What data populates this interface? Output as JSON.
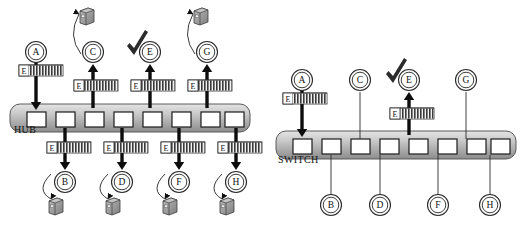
{
  "figure": {
    "title": "",
    "background_color": "#ffffff",
    "panels": [
      {
        "id": "hub-panel",
        "device_label": "HUB",
        "device_label_x": 14,
        "device_label_y": 133,
        "bar": {
          "x": 10,
          "y": 104,
          "width": 240,
          "height": 28,
          "radius": 10,
          "fill_top": "#d8d8d8",
          "fill_bottom": "#8e8e8e",
          "stroke": "#4a4a4a"
        },
        "ports": [
          {
            "id": "p1",
            "x": 27,
            "y": 112,
            "w": 19,
            "h": 15
          },
          {
            "id": "p2",
            "x": 56,
            "y": 112,
            "w": 19,
            "h": 15
          },
          {
            "id": "p3",
            "x": 85,
            "y": 112,
            "w": 19,
            "h": 15
          },
          {
            "id": "p4",
            "x": 114,
            "y": 112,
            "w": 19,
            "h": 15
          },
          {
            "id": "p5",
            "x": 143,
            "y": 112,
            "w": 19,
            "h": 15
          },
          {
            "id": "p6",
            "x": 172,
            "y": 112,
            "w": 19,
            "h": 15
          },
          {
            "id": "p7",
            "x": 201,
            "y": 112,
            "w": 19,
            "h": 15
          },
          {
            "id": "p8",
            "x": 225,
            "y": 112,
            "w": 19,
            "h": 15
          }
        ],
        "top_nodes": [
          {
            "label": "A",
            "cx": 36,
            "cy": 52,
            "has_computer": false,
            "checked": false
          },
          {
            "label": "C",
            "cx": 93,
            "cy": 52,
            "has_computer": true,
            "checked": false
          },
          {
            "label": "E",
            "cx": 150,
            "cy": 52,
            "has_computer": false,
            "checked": true
          },
          {
            "label": "G",
            "cx": 207,
            "cy": 52,
            "has_computer": true,
            "checked": false
          }
        ],
        "bottom_nodes": [
          {
            "label": "B",
            "cx": 65,
            "cy": 182,
            "has_computer": true
          },
          {
            "label": "D",
            "cx": 122,
            "cy": 182,
            "has_computer": true
          },
          {
            "label": "F",
            "cx": 179,
            "cy": 182,
            "has_computer": true
          },
          {
            "label": "H",
            "cx": 236,
            "cy": 182,
            "has_computer": true
          }
        ],
        "frames": [
          {
            "text": "E",
            "x": 19,
            "y": 65,
            "w": 44,
            "h": 11,
            "direction": "down"
          },
          {
            "text": "E",
            "x": 74,
            "y": 80,
            "w": 44,
            "h": 11,
            "direction": "up"
          },
          {
            "text": "E",
            "x": 131,
            "y": 80,
            "w": 44,
            "h": 11,
            "direction": "up"
          },
          {
            "text": "E",
            "x": 188,
            "y": 80,
            "w": 44,
            "h": 11,
            "direction": "up"
          },
          {
            "text": "E",
            "x": 47,
            "y": 142,
            "w": 44,
            "h": 11,
            "direction": "down"
          },
          {
            "text": "E",
            "x": 104,
            "y": 142,
            "w": 44,
            "h": 11,
            "direction": "down"
          },
          {
            "text": "E",
            "x": 161,
            "y": 142,
            "w": 44,
            "h": 11,
            "direction": "down"
          },
          {
            "text": "E",
            "x": 218,
            "y": 142,
            "w": 44,
            "h": 11,
            "direction": "down"
          }
        ],
        "arrows": [
          {
            "from_node": "A",
            "to_port": "p1",
            "x": 36,
            "y1": 62,
            "y2": 110,
            "dir": "down",
            "bold": true
          },
          {
            "to_node": "C",
            "from_port": "p3",
            "x": 93,
            "y1": 108,
            "y2": 64,
            "dir": "up",
            "bold": true
          },
          {
            "to_node": "E",
            "from_port": "p5",
            "x": 150,
            "y1": 108,
            "y2": 64,
            "dir": "up",
            "bold": true
          },
          {
            "to_node": "G",
            "from_port": "p7",
            "x": 207,
            "y1": 108,
            "y2": 64,
            "dir": "up",
            "bold": true
          },
          {
            "to_node": "B",
            "from_port": "p2",
            "x": 65,
            "y1": 128,
            "y2": 170,
            "dir": "down",
            "bold": true
          },
          {
            "to_node": "D",
            "from_port": "p4",
            "x": 122,
            "y1": 128,
            "y2": 170,
            "dir": "down",
            "bold": true
          },
          {
            "to_node": "F",
            "from_port": "p6",
            "x": 179,
            "y1": 128,
            "y2": 170,
            "dir": "down",
            "bold": true
          },
          {
            "to_node": "H",
            "from_port": "p8",
            "x": 236,
            "y1": 128,
            "y2": 170,
            "dir": "down",
            "bold": true
          }
        ]
      },
      {
        "id": "switch-panel",
        "device_label": "SWITCH",
        "device_label_x": 278,
        "device_label_y": 163,
        "bar": {
          "x": 276,
          "y": 131,
          "width": 240,
          "height": 28,
          "radius": 10,
          "fill_top": "#d8d8d8",
          "fill_bottom": "#8e8e8e",
          "stroke": "#4a4a4a"
        },
        "ports": [
          {
            "id": "q1",
            "x": 293,
            "y": 139,
            "w": 19,
            "h": 15
          },
          {
            "id": "q2",
            "x": 322,
            "y": 139,
            "w": 19,
            "h": 15
          },
          {
            "id": "q3",
            "x": 351,
            "y": 139,
            "w": 19,
            "h": 15
          },
          {
            "id": "q4",
            "x": 380,
            "y": 139,
            "w": 19,
            "h": 15
          },
          {
            "id": "q5",
            "x": 409,
            "y": 139,
            "w": 19,
            "h": 15
          },
          {
            "id": "q6",
            "x": 438,
            "y": 139,
            "w": 19,
            "h": 15
          },
          {
            "id": "q7",
            "x": 467,
            "y": 139,
            "w": 19,
            "h": 15
          },
          {
            "id": "q8",
            "x": 491,
            "y": 139,
            "w": 19,
            "h": 15
          }
        ],
        "top_nodes": [
          {
            "label": "A",
            "cx": 302,
            "cy": 80,
            "has_computer": false,
            "checked": false
          },
          {
            "label": "C",
            "cx": 360,
            "cy": 80,
            "has_computer": false,
            "checked": false
          },
          {
            "label": "E",
            "cx": 409,
            "cy": 80,
            "has_computer": false,
            "checked": true
          },
          {
            "label": "G",
            "cx": 466,
            "cy": 80,
            "has_computer": false,
            "checked": false
          }
        ],
        "bottom_nodes": [
          {
            "label": "B",
            "cx": 331,
            "cy": 205,
            "has_computer": false
          },
          {
            "label": "D",
            "cx": 380,
            "cy": 205,
            "has_computer": false
          },
          {
            "label": "F",
            "cx": 438,
            "cy": 205,
            "has_computer": false
          },
          {
            "label": "H",
            "cx": 490,
            "cy": 205,
            "has_computer": false
          }
        ],
        "frames": [
          {
            "text": "E",
            "x": 283,
            "y": 93,
            "w": 44,
            "h": 11,
            "direction": "down"
          },
          {
            "text": "E",
            "x": 390,
            "y": 108,
            "w": 44,
            "h": 11,
            "direction": "up"
          }
        ],
        "arrows": [
          {
            "from_node": "A",
            "to_port": "q1",
            "x": 302,
            "y1": 90,
            "y2": 137,
            "dir": "down",
            "bold": true
          },
          {
            "to_node": "E",
            "from_port": "q5",
            "x": 409,
            "y1": 135,
            "y2": 92,
            "dir": "up",
            "bold": true
          }
        ],
        "idle_links": [
          {
            "node": "C",
            "x": 360,
            "y1": 92,
            "y2": 139
          },
          {
            "node": "G",
            "x": 466,
            "y1": 92,
            "y2": 139
          },
          {
            "node": "B",
            "x": 331,
            "y1": 155,
            "y2": 195
          },
          {
            "node": "D",
            "x": 380,
            "y1": 155,
            "y2": 195
          },
          {
            "node": "F",
            "x": 438,
            "y1": 155,
            "y2": 195
          },
          {
            "node": "H",
            "x": 490,
            "y1": 155,
            "y2": 195
          }
        ]
      }
    ],
    "legend": {
      "node_shape": "double-circle",
      "frame_label": "E",
      "check_meaning": "intended-recipient",
      "computer_meaning": "host-receives-copy"
    },
    "colors": {
      "ink": "#111111",
      "bar_light": "#d8d8d8",
      "bar_dark": "#8e8e8e",
      "port_fill": "#ffffff",
      "computer_fill": "#9a9a9a",
      "frame_fill": "#efefef",
      "hatch": "#3a3a3a"
    }
  }
}
